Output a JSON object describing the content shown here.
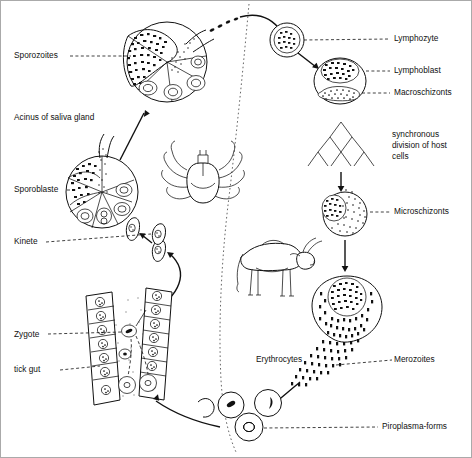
{
  "figure": {
    "background_color": "#ffffff",
    "ink_color": "#111111",
    "divider": "dotted-vertical-separator"
  },
  "labels": {
    "sporozoites": "Sporozoites",
    "acinus": "Acinus of saliva gland",
    "sporoblaste": "Sporoblaste",
    "kinete": "Kinete",
    "zygote": "Zygote",
    "tick_gut": "tick gut",
    "lymphozyte": "Lymphozyte",
    "lymphoblast": "Lymphoblast",
    "macroschizonts": "Macroschizonts",
    "synchronous_line1": "synchronous",
    "synchronous_line2": "division of host",
    "synchronous_line3": "cells",
    "microschizonts": "Microschizonts",
    "erythrocytes": "Erythrocytes",
    "merozoites": "Merozoites",
    "piroplasma": "Piroplasma-forms"
  },
  "organisms": {
    "tick": "tick-illustration",
    "cow": "cow-illustration"
  },
  "stages": [
    {
      "id": "sporozoites",
      "label": "Sporozoites",
      "side": "tick"
    },
    {
      "id": "acinus",
      "label": "Acinus of saliva gland",
      "side": "tick"
    },
    {
      "id": "sporoblaste",
      "label": "Sporoblaste",
      "side": "tick"
    },
    {
      "id": "kinete",
      "label": "Kinete",
      "side": "tick"
    },
    {
      "id": "zygote",
      "label": "Zygote",
      "side": "tick"
    },
    {
      "id": "tick_gut",
      "label": "tick gut",
      "side": "tick"
    },
    {
      "id": "lymphozyte",
      "label": "Lymphozyte",
      "side": "host"
    },
    {
      "id": "lymphoblast",
      "label": "Lymphoblast",
      "side": "host"
    },
    {
      "id": "macroschizonts",
      "label": "Macroschizonts",
      "side": "host"
    },
    {
      "id": "microschizonts",
      "label": "Microschizonts",
      "side": "host"
    },
    {
      "id": "merozoites",
      "label": "Merozoites",
      "side": "host"
    },
    {
      "id": "erythrocytes",
      "label": "Erythrocytes",
      "side": "host"
    },
    {
      "id": "piroplasma",
      "label": "Piroplasma-forms",
      "side": "host"
    }
  ]
}
